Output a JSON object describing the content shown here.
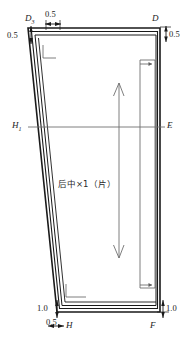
{
  "drawing": {
    "title": "后中×1（片）",
    "piece_label": "后中×1（片）",
    "stroke_color": "#1a1a1a",
    "thin_color": "#6f6f6f",
    "background": "#ffffff"
  },
  "points": {
    "top_left": {
      "letter": "D",
      "subscript": "3"
    },
    "top_right": {
      "letter": "D",
      "subscript": ""
    },
    "mid_left": {
      "letter": "H",
      "subscript": "1"
    },
    "mid_right": {
      "letter": "E",
      "subscript": ""
    },
    "bottom_left": {
      "letter": "H",
      "subscript": ""
    },
    "bottom_right": {
      "letter": "F",
      "subscript": ""
    }
  },
  "dimensions": {
    "top_horizontal": "0.5",
    "top_left_vertical": "0.5",
    "top_right_vertical": "0.5",
    "bottom_left_vertical": "1.0",
    "bottom_left_horizontal": "0.5",
    "bottom_right_vertical": "1.0"
  },
  "grainline": {
    "name": "grain-line",
    "direction": "vertical-double-arrow"
  }
}
